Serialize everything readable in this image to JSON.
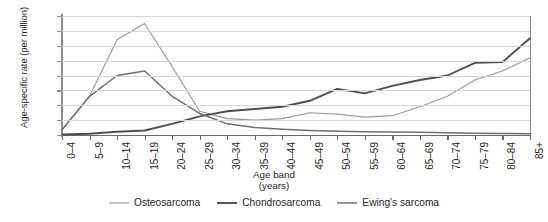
{
  "chart_data": {
    "type": "line",
    "title": "",
    "xlabel": "Age band (years)",
    "xlabel_line1": "Age band",
    "xlabel_line2": "(years)",
    "ylabel": "Age-specific rate (per million)",
    "ylim": [
      0,
      8
    ],
    "yticks": [
      0,
      1,
      2,
      3,
      4,
      5,
      6,
      7,
      8
    ],
    "grid": true,
    "legend_position": "bottom",
    "categories": [
      "0–4",
      "5–9",
      "10–14",
      "15–19",
      "20–24",
      "25–29",
      "30–34",
      "35–39",
      "40–44",
      "45–49",
      "50–54",
      "55–59",
      "60–64",
      "65–69",
      "70–74",
      "75–79",
      "80–84",
      "85+"
    ],
    "series": [
      {
        "name": "Osteosarcoma",
        "color": "#9a9a9a",
        "width": 1.1,
        "values": [
          0.35,
          2.6,
          6.4,
          7.5,
          4.6,
          1.6,
          1.1,
          1.0,
          1.1,
          1.5,
          1.4,
          1.2,
          1.3,
          1.9,
          2.6,
          3.7,
          4.3,
          5.2
        ]
      },
      {
        "name": "Chondrosarcoma",
        "color": "#4f4f4f",
        "width": 1.9,
        "values": [
          0.03,
          0.08,
          0.22,
          0.3,
          0.75,
          1.25,
          1.6,
          1.75,
          1.9,
          2.3,
          3.1,
          2.8,
          3.3,
          3.7,
          4.0,
          4.85,
          4.9,
          6.5
        ]
      },
      {
        "name": "Ewing's sarcoma",
        "color": "#6f6f6f",
        "width": 1.5,
        "values": [
          0.35,
          2.6,
          4.0,
          4.3,
          2.6,
          1.45,
          0.75,
          0.5,
          0.38,
          0.3,
          0.26,
          0.22,
          0.2,
          0.18,
          0.15,
          0.12,
          0.1,
          0.08
        ]
      }
    ]
  }
}
